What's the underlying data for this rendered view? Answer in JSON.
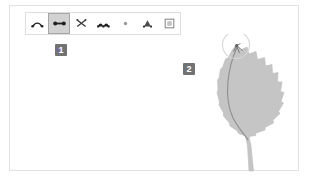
{
  "app": {
    "canvas_background": "#ffffff",
    "frame_border_color": "#e2e2e2"
  },
  "toolbar": {
    "name": "shape-edit-toolbar",
    "selected_index": 1,
    "selected_fill": "#d2d2d2",
    "border_color": "#dedede",
    "buttons": [
      {
        "id": "smooth-curve-tool",
        "icon": "smooth-curve-icon",
        "label": "Smooth",
        "selected": false
      },
      {
        "id": "straighten-tool",
        "icon": "straight-segment-icon",
        "label": "Straighten",
        "selected": true
      },
      {
        "id": "cut-path-tool",
        "icon": "scissors-cut-icon",
        "label": "Cut",
        "selected": false
      },
      {
        "id": "corner-node-tool",
        "icon": "corner-node-icon",
        "label": "Corner",
        "selected": false
      },
      {
        "id": "add-node-tool",
        "icon": "add-node-dot-icon",
        "label": "Add node",
        "selected": false
      },
      {
        "id": "symmetric-node-tool",
        "icon": "symmetric-node-icon",
        "label": "Symmetric",
        "selected": false
      },
      {
        "id": "bounding-box-tool",
        "icon": "bounding-box-icon",
        "label": "Object bounds",
        "selected": false
      }
    ]
  },
  "annotations": {
    "badge_color": "#727272",
    "badge_text_color": "#ffffff",
    "steps": [
      {
        "number": "1",
        "target": "toolbar-selected-button"
      },
      {
        "number": "2",
        "target": "leaf-illustration"
      }
    ]
  },
  "artwork": {
    "name": "serrated-leaf-illustration",
    "leaf_fill": "#c5c5c5",
    "leaf_stroke": "#b5b5b5",
    "midrib_color": "#8e8e8e",
    "selection_circle_color": "#d4d4d4",
    "node_marker_color": "#6b6b6b",
    "description": "Serrated leaf with curved midrib and selection ring at the tip"
  }
}
